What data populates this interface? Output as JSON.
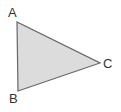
{
  "diagram": {
    "type": "triangle",
    "fill": "#dcdcdc",
    "stroke": "#666666",
    "vertices": [
      {
        "label": "A",
        "x": 17,
        "y": 22
      },
      {
        "label": "B",
        "x": 18,
        "y": 91
      },
      {
        "label": "C",
        "x": 100,
        "y": 63
      }
    ]
  }
}
